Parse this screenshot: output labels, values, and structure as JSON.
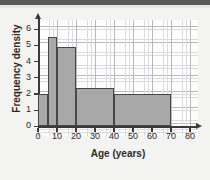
{
  "chart_data": {
    "type": "bar",
    "title": "",
    "xlabel": "Age (years)",
    "ylabel": "Frequency density",
    "xlim": [
      0,
      85
    ],
    "ylim": [
      0,
      6.6
    ],
    "grid": true,
    "legend": "none",
    "bin_edges": [
      0,
      5,
      10,
      20,
      40,
      70
    ],
    "values": [
      2.0,
      5.5,
      4.9,
      2.4,
      2.0
    ],
    "bars": [
      {
        "x_start": 0,
        "x_end": 5,
        "height": 2.0
      },
      {
        "x_start": 5,
        "x_end": 10,
        "height": 5.5
      },
      {
        "x_start": 10,
        "x_end": 20,
        "height": 4.9
      },
      {
        "x_start": 20,
        "x_end": 40,
        "height": 2.4
      },
      {
        "x_start": 40,
        "x_end": 70,
        "height": 2.0
      }
    ],
    "x_ticks": [
      "0",
      "10",
      "20",
      "30",
      "40",
      "50",
      "60",
      "70",
      "80"
    ],
    "x_tick_values": [
      0,
      10,
      20,
      30,
      40,
      50,
      60,
      70,
      80
    ],
    "y_ticks": [
      "0",
      "1",
      "2",
      "3",
      "4",
      "5",
      "6"
    ],
    "y_tick_values": [
      0,
      1,
      2,
      3,
      4,
      5,
      6
    ],
    "bar_fill_color": "#a8a8a8",
    "bar_edge_color": "#474747",
    "grid_major_color": "#b9b9bb",
    "grid_minor_color": "#dcdcde",
    "axis_color": "#3a3a3a"
  }
}
